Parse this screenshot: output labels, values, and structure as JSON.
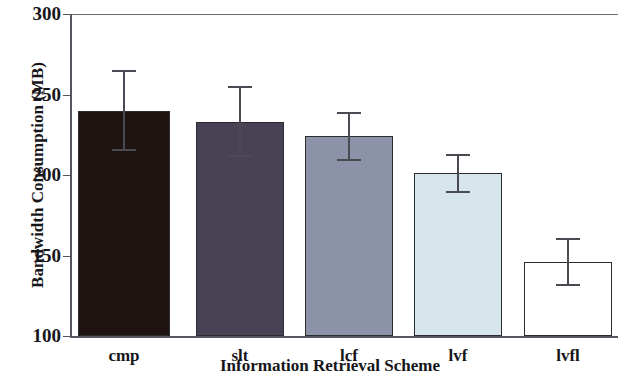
{
  "chart_data": {
    "type": "bar",
    "title": "",
    "xlabel": "Information Retrieval Scheme",
    "ylabel": "Bandwidth Consumption (MB)",
    "categories": [
      "cmp",
      "slt",
      "lcf",
      "lvf",
      "lvfl"
    ],
    "values": [
      240,
      233,
      224,
      201,
      146
    ],
    "errors": [
      25,
      22,
      15,
      12,
      15
    ],
    "ylim": [
      100,
      300
    ],
    "yticks": [
      100,
      150,
      200,
      250,
      300
    ],
    "ytick_labels": [
      "100",
      "150",
      "200",
      "250",
      "300"
    ],
    "grid": false,
    "legend": "none",
    "bar_colors": [
      "#1f1412",
      "#494254",
      "#8c93a8",
      "#d7e6ec",
      "#ffffff"
    ],
    "bar_edge_color": "#2b2b30",
    "error_bar_color": "#4a4a52",
    "axis_color": "#555560",
    "background": "#ffffff"
  }
}
